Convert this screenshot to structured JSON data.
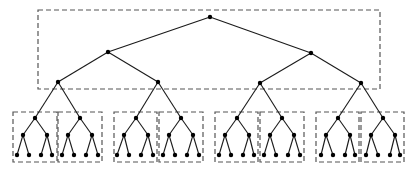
{
  "diagram": {
    "type": "hierarchical-tree",
    "colors": {
      "edge": "#1a1a1a",
      "node": "#000000",
      "box": "#555555",
      "background": "#ffffff"
    },
    "node_radius": 2.2,
    "top_box": {
      "x": 38,
      "y": 10,
      "w": 342,
      "h": 79
    },
    "top_nodes": [
      {
        "id": "r",
        "x": 210,
        "y": 17
      },
      {
        "id": "a",
        "x": 108,
        "y": 52,
        "parent": "r"
      },
      {
        "id": "b",
        "x": 311,
        "y": 53,
        "parent": "r"
      },
      {
        "id": "a1",
        "x": 58,
        "y": 82,
        "parent": "a"
      },
      {
        "id": "a2",
        "x": 158,
        "y": 82,
        "parent": "a"
      },
      {
        "id": "b1",
        "x": 260,
        "y": 83,
        "parent": "b"
      },
      {
        "id": "b2",
        "x": 361,
        "y": 83,
        "parent": "b"
      }
    ],
    "bottom_blocks": [
      {
        "parent": "a1",
        "box": {
          "x": 13,
          "y": 112,
          "w": 44,
          "h": 50
        },
        "root": [
          35,
          118
        ],
        "mid": [
          [
            23,
            135
          ],
          [
            47,
            135
          ]
        ],
        "leaves": [
          [
            17,
            155
          ],
          [
            29,
            155
          ],
          [
            41,
            155
          ],
          [
            52,
            155
          ]
        ]
      },
      {
        "parent": "a1",
        "box": {
          "x": 58,
          "y": 112,
          "w": 44,
          "h": 50
        },
        "root": [
          80,
          118
        ],
        "mid": [
          [
            68,
            135
          ],
          [
            92,
            135
          ]
        ],
        "leaves": [
          [
            62,
            155
          ],
          [
            74,
            155
          ],
          [
            86,
            155
          ],
          [
            98,
            155
          ]
        ]
      },
      {
        "parent": "a2",
        "box": {
          "x": 114,
          "y": 112,
          "w": 43,
          "h": 50
        },
        "root": [
          136,
          118
        ],
        "mid": [
          [
            124,
            135
          ],
          [
            148,
            135
          ]
        ],
        "leaves": [
          [
            117,
            155
          ],
          [
            129,
            155
          ],
          [
            141,
            155
          ],
          [
            153,
            155
          ]
        ]
      },
      {
        "parent": "a2",
        "box": {
          "x": 159,
          "y": 112,
          "w": 44,
          "h": 50
        },
        "root": [
          181,
          118
        ],
        "mid": [
          [
            169,
            135
          ],
          [
            193,
            135
          ]
        ],
        "leaves": [
          [
            163,
            155
          ],
          [
            175,
            155
          ],
          [
            187,
            155
          ],
          [
            199,
            155
          ]
        ]
      },
      {
        "parent": "b1",
        "box": {
          "x": 215,
          "y": 112,
          "w": 43,
          "h": 50
        },
        "root": [
          237,
          118
        ],
        "mid": [
          [
            225,
            135
          ],
          [
            249,
            135
          ]
        ],
        "leaves": [
          [
            219,
            155
          ],
          [
            231,
            155
          ],
          [
            243,
            155
          ],
          [
            254,
            155
          ]
        ]
      },
      {
        "parent": "b1",
        "box": {
          "x": 260,
          "y": 112,
          "w": 44,
          "h": 50
        },
        "root": [
          282,
          118
        ],
        "mid": [
          [
            270,
            135
          ],
          [
            294,
            135
          ]
        ],
        "leaves": [
          [
            264,
            155
          ],
          [
            276,
            155
          ],
          [
            288,
            155
          ],
          [
            300,
            155
          ]
        ]
      },
      {
        "parent": "b2",
        "box": {
          "x": 316,
          "y": 112,
          "w": 43,
          "h": 50
        },
        "root": [
          338,
          118
        ],
        "mid": [
          [
            326,
            135
          ],
          [
            350,
            135
          ]
        ],
        "leaves": [
          [
            321,
            155
          ],
          [
            333,
            155
          ],
          [
            345,
            155
          ],
          [
            355,
            155
          ]
        ]
      },
      {
        "parent": "b2",
        "box": {
          "x": 361,
          "y": 112,
          "w": 43,
          "h": 50
        },
        "root": [
          383,
          118
        ],
        "mid": [
          [
            371,
            135
          ],
          [
            395,
            135
          ]
        ],
        "leaves": [
          [
            366,
            155
          ],
          [
            378,
            155
          ],
          [
            390,
            155
          ],
          [
            400,
            155
          ]
        ]
      }
    ]
  }
}
